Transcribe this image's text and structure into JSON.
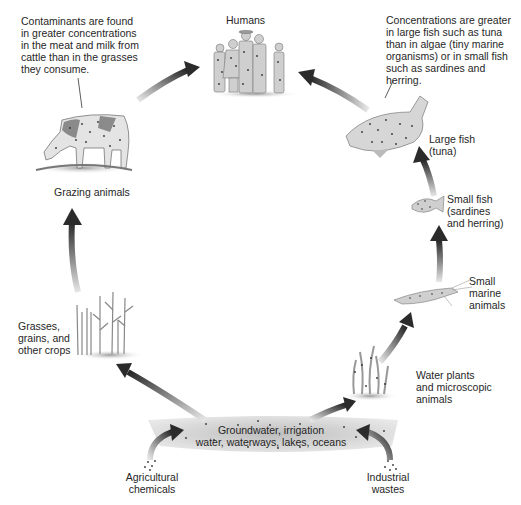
{
  "diagram": {
    "nodes": {
      "humans": {
        "label": "Humans",
        "icon": "humans-icon"
      },
      "grazing": {
        "label": "Grazing animals",
        "icon": "cow-icon"
      },
      "crops": {
        "lines": [
          "Grasses,",
          "grains, and",
          "other crops"
        ],
        "icon": "crops-icon"
      },
      "water": {
        "lines": [
          "Groundwater, irrigation",
          "water, waterways, lakes, oceans"
        ],
        "icon": "water-band-icon"
      },
      "agri": {
        "lines": [
          "Agricultural",
          "chemicals"
        ],
        "icon": "droplets-icon"
      },
      "industrial": {
        "lines": [
          "Industrial",
          "wastes"
        ],
        "icon": "droplets-icon"
      },
      "waterplants": {
        "lines": [
          "Water plants",
          "and microscopic",
          "animals"
        ],
        "icon": "water-plants-icon"
      },
      "smallmarine": {
        "lines": [
          "Small",
          "marine",
          "animals"
        ],
        "icon": "shrimp-icon"
      },
      "smallfish": {
        "lines": [
          "Small fish",
          "(sardines",
          "and herring)"
        ],
        "icon": "small-fish-icon"
      },
      "largefish": {
        "lines": [
          "Large fish",
          "(tuna)"
        ],
        "icon": "large-fish-icon"
      }
    },
    "callouts": {
      "cattle": {
        "lines": [
          "Contaminants are found",
          "in greater concentrations",
          "in the meat and milk from",
          "cattle than in the grasses",
          "they consume."
        ]
      },
      "fish": {
        "lines": [
          "Concentrations are greater",
          "in large fish such as tuna",
          "than in algae (tiny marine",
          "organisms) or in small fish",
          "such as sardines and",
          "herring."
        ]
      }
    },
    "arrows": [
      {
        "from": "Agricultural chemicals",
        "to": "Groundwater"
      },
      {
        "from": "Industrial wastes",
        "to": "Groundwater"
      },
      {
        "from": "Groundwater",
        "to": "Grasses, grains, and other crops"
      },
      {
        "from": "Groundwater",
        "to": "Water plants and microscopic animals"
      },
      {
        "from": "Grasses, grains, and other crops",
        "to": "Grazing animals"
      },
      {
        "from": "Grazing animals",
        "to": "Humans"
      },
      {
        "from": "Water plants and microscopic animals",
        "to": "Small marine animals"
      },
      {
        "from": "Small marine animals",
        "to": "Small fish"
      },
      {
        "from": "Small fish",
        "to": "Large fish"
      },
      {
        "from": "Large fish",
        "to": "Humans"
      }
    ],
    "colors": {
      "arrow_dark": "#2b2b2b",
      "arrow_light": "#d8d8d8",
      "water_band": "#c9c9c9",
      "text": "#262626"
    }
  }
}
